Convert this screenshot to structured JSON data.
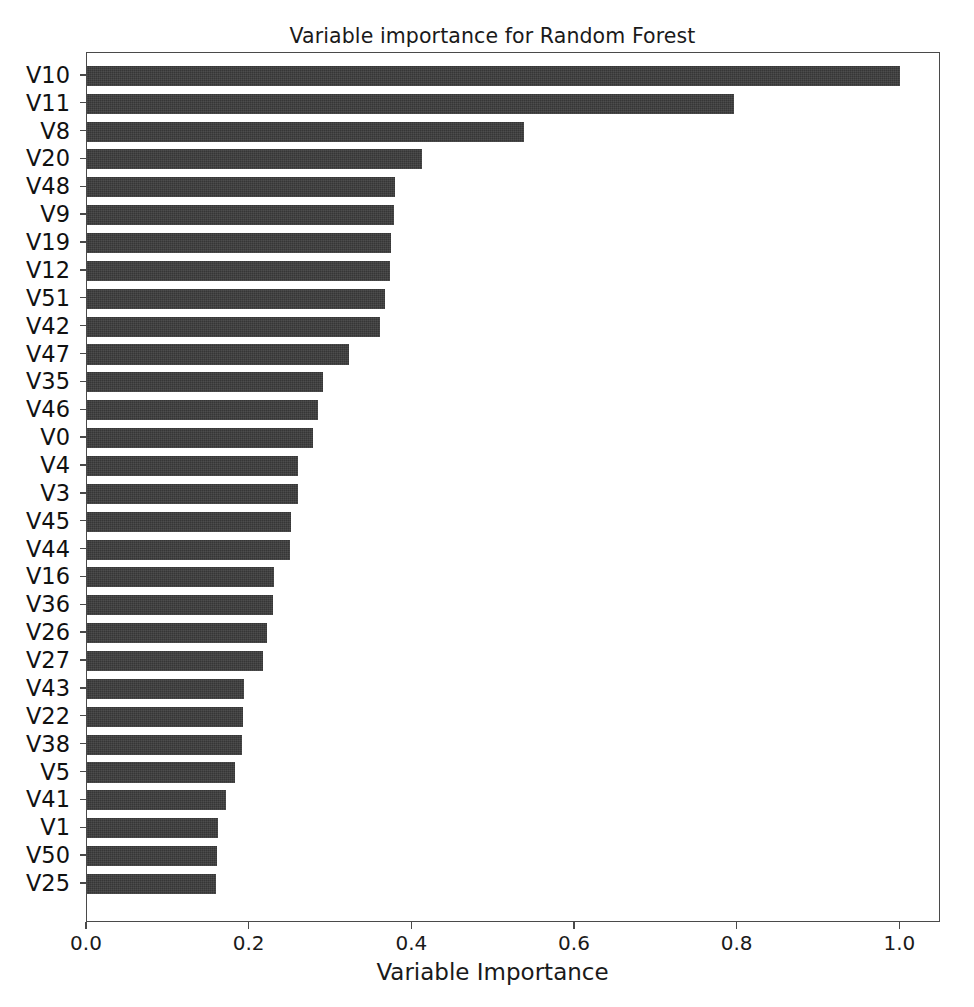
{
  "chart_data": {
    "type": "bar",
    "orientation": "horizontal",
    "title": "Variable importance for Random Forest",
    "xlabel": "Variable Importance",
    "ylabel": "",
    "xlim": [
      0.0,
      1.05
    ],
    "xticks": [
      0.0,
      0.2,
      0.4,
      0.6,
      0.8,
      1.0
    ],
    "xtick_labels": [
      "0.0",
      "0.2",
      "0.4",
      "0.6",
      "0.8",
      "1.0"
    ],
    "grid": false,
    "legend": null,
    "bar_color": "#3b3b3b",
    "categories": [
      "V10",
      "V11",
      "V8",
      "V20",
      "V48",
      "V9",
      "V19",
      "V12",
      "V51",
      "V42",
      "V47",
      "V35",
      "V46",
      "V0",
      "V4",
      "V3",
      "V45",
      "V44",
      "V16",
      "V36",
      "V26",
      "V27",
      "V43",
      "V22",
      "V38",
      "V5",
      "V41",
      "V1",
      "V50",
      "V25"
    ],
    "values": [
      1.0,
      0.796,
      0.537,
      0.412,
      0.379,
      0.378,
      0.374,
      0.373,
      0.366,
      0.36,
      0.322,
      0.29,
      0.284,
      0.278,
      0.26,
      0.259,
      0.251,
      0.25,
      0.23,
      0.229,
      0.221,
      0.217,
      0.193,
      0.192,
      0.19,
      0.182,
      0.171,
      0.161,
      0.16,
      0.158
    ]
  }
}
